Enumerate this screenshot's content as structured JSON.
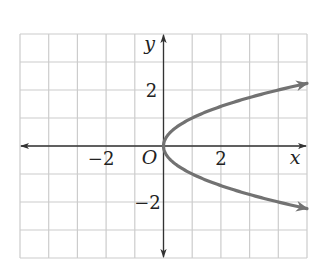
{
  "chart_data": {
    "type": "line",
    "title": "",
    "equation": "x = y^2",
    "xlabel": "x",
    "ylabel": "y",
    "origin_label": "O",
    "xlim": [
      -5,
      5
    ],
    "ylim": [
      -4,
      4
    ],
    "grid": true,
    "x_ticks": [
      {
        "value": -2,
        "label": "−2"
      },
      {
        "value": 2,
        "label": "2"
      }
    ],
    "y_ticks": [
      {
        "value": 2,
        "label": "2"
      },
      {
        "value": -2,
        "label": "−2"
      }
    ],
    "series": [
      {
        "name": "upper branch y = √x",
        "x": [
          0,
          0.25,
          0.5,
          1,
          2,
          3,
          4,
          5
        ],
        "y": [
          0,
          0.5,
          0.71,
          1,
          1.41,
          1.73,
          2,
          2.24
        ]
      },
      {
        "name": "lower branch y = −√x",
        "x": [
          0,
          0.25,
          0.5,
          1,
          2,
          3,
          4,
          5
        ],
        "y": [
          0,
          -0.5,
          -0.71,
          -1,
          -1.41,
          -1.73,
          -2,
          -2.24
        ]
      }
    ],
    "colors": {
      "curve": "#727272",
      "axis": "#333333",
      "grid": "#cccccc"
    }
  }
}
